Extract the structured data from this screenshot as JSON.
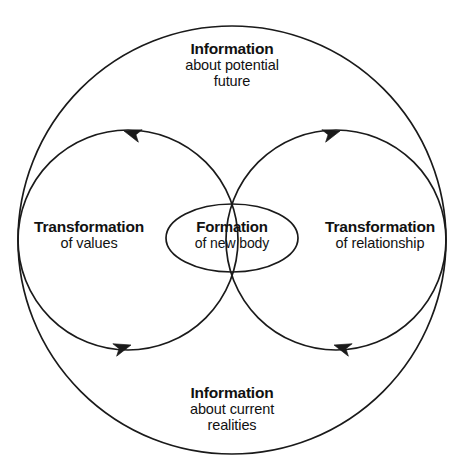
{
  "diagram": {
    "type": "concentric-circles-flow",
    "canvas": {
      "width": 464,
      "height": 473
    },
    "colors": {
      "background": "#ffffff",
      "stroke": "#1a1a1a",
      "text": "#111111"
    },
    "shapes": {
      "outer_circle": {
        "cx": 232,
        "cy": 240,
        "r": 214
      },
      "left_circle": {
        "cx": 128,
        "cy": 240,
        "r": 110
      },
      "right_circle": {
        "cx": 336,
        "cy": 240,
        "r": 110
      },
      "center_ellipse": {
        "cx": 232,
        "cy": 238,
        "rx": 66,
        "ry": 34
      }
    },
    "arrows": [
      {
        "name": "top-left-arrow",
        "direction": "right",
        "x": 124,
        "y": 131,
        "rotation": 20
      },
      {
        "name": "top-right-arrow",
        "direction": "left",
        "x": 340,
        "y": 131,
        "rotation": -20
      },
      {
        "name": "bottom-left-arrow",
        "direction": "left",
        "x": 131,
        "y": 345,
        "rotation": 20
      },
      {
        "name": "bottom-right-arrow",
        "direction": "right",
        "x": 334,
        "y": 345,
        "rotation": -20
      }
    ]
  },
  "labels": {
    "top": {
      "title": "Information",
      "line1": "about potential",
      "line2": "future"
    },
    "bottom": {
      "title": "Information",
      "line1": "about current",
      "line2": "realities"
    },
    "left": {
      "title": "Transformation",
      "line1": "of values"
    },
    "right": {
      "title": "Transformation",
      "line1": "of relationship"
    },
    "center": {
      "title": "Formation",
      "line1": "of new  body"
    }
  }
}
